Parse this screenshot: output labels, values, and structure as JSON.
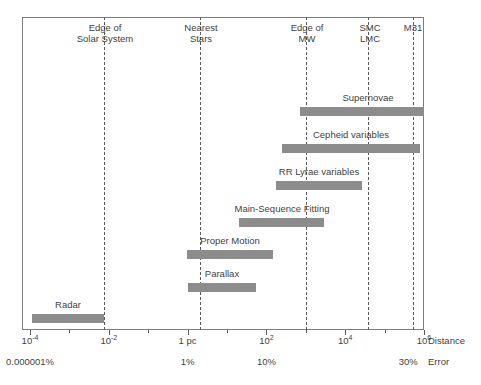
{
  "chart_data": {
    "type": "bar",
    "title": "",
    "orientation": "horizontal-range",
    "xlabel": "Distance",
    "ylabel": "",
    "x_scale": "log10",
    "xlim": [
      -4,
      6
    ],
    "grid": false,
    "legend": "none",
    "x_unit": "pc",
    "axis_primary": {
      "caption": "Distance",
      "ticks": [
        {
          "label_html": "10<sup>-4</sup>",
          "value": -4
        },
        {
          "label_html": "10<sup>-2</sup>",
          "value": -2
        },
        {
          "label_html": "1 pc",
          "value": 0
        },
        {
          "label_html": "10<sup>2</sup>",
          "value": 2
        },
        {
          "label_html": "10<sup>4</sup>",
          "value": 4
        },
        {
          "label_html": "10<sup>6</sup>",
          "value": 6
        }
      ]
    },
    "axis_secondary": {
      "caption": "Error",
      "ticks": [
        {
          "label": "0.000001%",
          "value": -4
        },
        {
          "label": "1%",
          "value": 0
        },
        {
          "label": "10%",
          "value": 2
        },
        {
          "label": "30%",
          "value": 5.6
        }
      ]
    },
    "landmarks": [
      {
        "label": "Edge of\nSolar System",
        "value": -2.12,
        "label_x": 105
      },
      {
        "label": "Nearest\nStars",
        "value": 0.31,
        "label_x": 201
      },
      {
        "label": "Edge of\nMW",
        "value": 3.0,
        "label_x": 307
      },
      {
        "label": "SMC\nLMC",
        "value": 4.57,
        "label_x": 370
      },
      {
        "label": "M31",
        "value": 5.71,
        "label_x": 413
      }
    ],
    "series": [
      {
        "name": "Supernovae",
        "start": 2.85,
        "end": 6.0,
        "label_x": 368,
        "label_y": 92
      },
      {
        "name": "Cepheid variables",
        "start": 2.4,
        "end": 5.9,
        "label_x": 351,
        "label_y": 129
      },
      {
        "name": "RR Lyrae variables",
        "start": 2.25,
        "end": 4.43,
        "label_x": 319,
        "label_y": 166
      },
      {
        "name": "Main-Sequence Fitting",
        "start": 1.3,
        "end": 3.46,
        "label_x": 282,
        "label_y": 203
      },
      {
        "name": "Proper Motion",
        "start": -0.02,
        "end": 2.16,
        "label_x": 230,
        "label_y": 235
      },
      {
        "name": "Parallax",
        "start": 0.0,
        "end": 1.73,
        "label_x": 222,
        "label_y": 268
      },
      {
        "name": "Radar",
        "start": -3.96,
        "end": -2.11,
        "label_x": 68,
        "label_y": 299
      }
    ]
  }
}
